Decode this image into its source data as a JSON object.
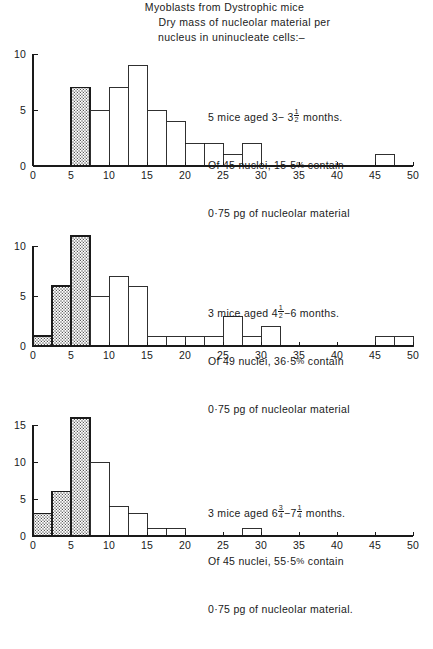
{
  "title": {
    "line1": "Myoblasts from Dystrophic mice",
    "line2": "Dry mass of nucleolar material per",
    "line3": "nucleus in uninucleate cells:–"
  },
  "axis": {
    "x_ticks": [
      0,
      5,
      10,
      15,
      20,
      25,
      30,
      35,
      40,
      45,
      50
    ],
    "x_min": 0,
    "x_max": 50,
    "bin_width": 2.5
  },
  "panels": [
    {
      "id": "panel-1",
      "annotation": {
        "line1_pre": "5 mice aged 3− 3",
        "line1_frac_num": "1",
        "line1_frac_den": "2",
        "line1_post": " months.",
        "line2_pre": "Of 45 nuclei, 15·5",
        "line2_pct": "%",
        "line2_post": " contain",
        "line3": "0·75 pg of nucleolar material"
      },
      "mice_count": 5,
      "age_range": "3−3½ months",
      "nuclei_total": 45,
      "percent_contain": "15·5%",
      "threshold_pg": "0·75 pg",
      "y_ticks": [
        0,
        5,
        10
      ],
      "y_max": 10
    },
    {
      "id": "panel-2",
      "annotation": {
        "line1_pre": "3 mice aged 4",
        "line1_frac_num": "1",
        "line1_frac_den": "2",
        "line1_post": "−6 months.",
        "line2_pre": "Of 49 nuclei, 36·5",
        "line2_pct": "%",
        "line2_post": " contain",
        "line3": "0·75 pg of nucleolar material"
      },
      "mice_count": 3,
      "age_range": "4½−6 months",
      "nuclei_total": 49,
      "percent_contain": "36·5%",
      "threshold_pg": "0·75 pg",
      "y_ticks": [
        0,
        5,
        10
      ],
      "y_max": 11
    },
    {
      "id": "panel-3",
      "annotation": {
        "line1_pre": "3 mice aged 6",
        "line1_frac_num": "3",
        "line1_frac_den": "4",
        "line1_mid": "−7",
        "line1_frac2_num": "1",
        "line1_frac2_den": "4",
        "line1_post": " months.",
        "line2_pre": "Of 45 nuclei, 55·5",
        "line2_pct": "%",
        "line2_post": " contain",
        "line3": "0·75 pg of nucleolar material."
      },
      "mice_count": 3,
      "age_range": "6¾−7¼ months",
      "nuclei_total": 45,
      "percent_contain": "55·5%",
      "threshold_pg": "0·75 pg",
      "y_ticks": [
        0,
        5,
        10,
        15
      ],
      "y_max": 16
    }
  ],
  "chart_data": [
    {
      "type": "bar",
      "title": "5 mice aged 3-3½ months",
      "xlabel": "Dry mass of nucleolar material (pg × 10⁻¹)",
      "ylabel": "Number of nuclei",
      "xlim": [
        0,
        50
      ],
      "ylim": [
        0,
        10
      ],
      "grid": false,
      "bin_width": 2.5,
      "bin_starts": [
        0,
        2.5,
        5,
        7.5,
        10,
        12.5,
        15,
        17.5,
        20,
        22.5,
        25,
        27.5,
        30,
        32.5,
        35,
        37.5,
        40,
        42.5,
        45,
        47.5
      ],
      "values": [
        0,
        0,
        7,
        5,
        7,
        9,
        5,
        4,
        2,
        2,
        1,
        2,
        0,
        0,
        0,
        0,
        0,
        0,
        1,
        0
      ],
      "shaded_bins": [
        2
      ],
      "shaded_note": "Hatched bar marks nuclei containing 0·75 pg of nucleolar material"
    },
    {
      "type": "bar",
      "title": "3 mice aged 4½-6 months",
      "xlabel": "Dry mass of nucleolar material (pg × 10⁻¹)",
      "ylabel": "Number of nuclei",
      "xlim": [
        0,
        50
      ],
      "ylim": [
        0,
        11
      ],
      "grid": false,
      "bin_width": 2.5,
      "bin_starts": [
        0,
        2.5,
        5,
        7.5,
        10,
        12.5,
        15,
        17.5,
        20,
        22.5,
        25,
        27.5,
        30,
        32.5,
        35,
        37.5,
        40,
        42.5,
        45,
        47.5
      ],
      "values": [
        1,
        6,
        11,
        5,
        7,
        6,
        1,
        1,
        1,
        1,
        3,
        1,
        2,
        0,
        0,
        0,
        0,
        0,
        1,
        1
      ],
      "shaded_bins": [
        0,
        1,
        2
      ],
      "shaded_note": "Hatched bars mark nuclei containing 0·75 pg of nucleolar material"
    },
    {
      "type": "bar",
      "title": "3 mice aged 6¾-7¼ months",
      "xlabel": "Dry mass of nucleolar material (pg × 10⁻¹)",
      "ylabel": "Number of nuclei",
      "xlim": [
        0,
        50
      ],
      "ylim": [
        0,
        16
      ],
      "grid": false,
      "bin_width": 2.5,
      "bin_starts": [
        0,
        2.5,
        5,
        7.5,
        10,
        12.5,
        15,
        17.5,
        20,
        22.5,
        25,
        27.5,
        30,
        32.5,
        35,
        37.5,
        40,
        42.5,
        45,
        47.5
      ],
      "values": [
        3,
        6,
        16,
        10,
        4,
        3,
        1,
        1,
        0,
        0,
        0,
        1,
        0,
        0,
        0,
        0,
        0,
        0,
        0,
        0
      ],
      "shaded_bins": [
        0,
        1,
        2
      ],
      "shaded_note": "Hatched bars mark nuclei containing 0·75 pg of nucleolar material"
    }
  ]
}
